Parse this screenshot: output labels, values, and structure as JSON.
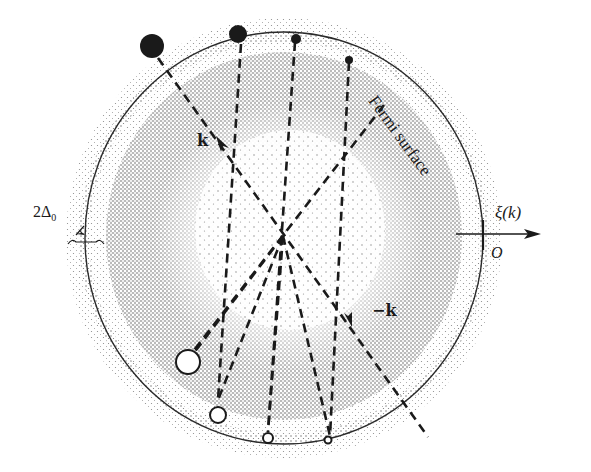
{
  "figure": {
    "labels": {
      "fermi_surface": "Fermi surface",
      "axis": "ξ(k)",
      "origin": "O",
      "k_vector": "k",
      "minus_k_vector": "−k",
      "gap": "2Δ",
      "gap_subscript": "0"
    },
    "colors": {
      "ink": "#1a1a1a",
      "stipple_dark": "#555555",
      "stipple_light": "#8a8a8a",
      "background": "#ffffff"
    },
    "geometry": {
      "center": [
        284,
        238
      ],
      "fermi_radius": 205,
      "inner_sea_radius": 178,
      "outer_shell_radius": 218
    },
    "pair_lines": [
      {
        "angle_deg": 122,
        "occupied_r": 224,
        "occupied_size": 12,
        "hole_r": 138,
        "hole_size": 12,
        "through": true
      },
      {
        "angle_deg": 102,
        "occupied_r": 210,
        "occupied_size": 9,
        "hole_r": 188,
        "hole_size": 9
      },
      {
        "angle_deg": 87,
        "occupied_r": 200,
        "occupied_size": 5,
        "hole_r": 210,
        "hole_size": 5
      },
      {
        "angle_deg": 70,
        "occupied_r": 188,
        "occupied_size": 4,
        "hole_r": 216,
        "hole_size": 4
      },
      {
        "angle_deg": 53,
        "occupied_r": 0,
        "occupied_size": 0,
        "hole_r": 0,
        "hole_size": 0,
        "free_line": true
      }
    ]
  }
}
